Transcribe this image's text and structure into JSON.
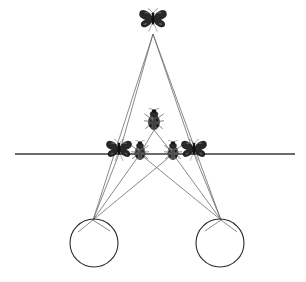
{
  "canvas": {
    "width": 306,
    "height": 282,
    "background": "#ffffff"
  },
  "figure": {
    "stroke_color": "#6b6b6b",
    "axis_color": "#3a3a3a",
    "circle_color": "#2b2b2b",
    "stroke_width": 0.8,
    "axis_width": 1.4,
    "circle_width": 1.1
  },
  "axis": {
    "name": "horizontal-axis",
    "x1": 15,
    "y1": 154,
    "x2": 295,
    "y2": 154
  },
  "circles": [
    {
      "name": "left-circle",
      "cx": 94,
      "cy": 243,
      "r": 24
    },
    {
      "name": "right-circle",
      "cx": 220,
      "cy": 243,
      "r": 24
    }
  ],
  "nodes": {
    "apex": {
      "x": 153,
      "y": 34
    },
    "mid_beetle": {
      "x": 154,
      "y": 130
    },
    "left_butterfly": {
      "x": 119,
      "y": 154
    },
    "left_beetle": {
      "x": 140,
      "y": 154
    },
    "right_beetle": {
      "x": 173,
      "y": 154
    },
    "right_butterfly": {
      "x": 194,
      "y": 154
    },
    "left_focus": {
      "x": 93,
      "y": 220
    },
    "right_focus": {
      "x": 221,
      "y": 220
    }
  },
  "rays": [
    {
      "name": "ray-apex-to-left-focus",
      "x1": 153,
      "y1": 34,
      "x2": 93,
      "y2": 220
    },
    {
      "name": "ray-apex-to-right-focus",
      "x1": 153,
      "y1": 34,
      "x2": 221,
      "y2": 220
    },
    {
      "name": "ray-apex-to-left-butterfly",
      "x1": 153,
      "y1": 34,
      "x2": 119,
      "y2": 154
    },
    {
      "name": "ray-apex-to-right-butterfly",
      "x1": 153,
      "y1": 34,
      "x2": 194,
      "y2": 154
    },
    {
      "name": "ray-midbeetle-to-left-beetle",
      "x1": 154,
      "y1": 130,
      "x2": 140,
      "y2": 154
    },
    {
      "name": "ray-midbeetle-to-right-beetle",
      "x1": 154,
      "y1": 130,
      "x2": 173,
      "y2": 154
    },
    {
      "name": "ray-left-beetle-to-left-focus",
      "x1": 140,
      "y1": 154,
      "x2": 93,
      "y2": 220
    },
    {
      "name": "ray-right-beetle-to-right-focus",
      "x1": 173,
      "y1": 154,
      "x2": 221,
      "y2": 220
    },
    {
      "name": "ray-left-butterfly-to-left-focus",
      "x1": 119,
      "y1": 154,
      "x2": 93,
      "y2": 220
    },
    {
      "name": "ray-right-butterfly-to-right-focus",
      "x1": 194,
      "y1": 154,
      "x2": 221,
      "y2": 220
    },
    {
      "name": "ray-right-beetle-to-left-focus",
      "x1": 173,
      "y1": 154,
      "x2": 93,
      "y2": 220
    },
    {
      "name": "ray-left-beetle-to-right-focus",
      "x1": 140,
      "y1": 154,
      "x2": 221,
      "y2": 220
    },
    {
      "name": "ray-left-focus-to-circle-left",
      "x1": 93,
      "y1": 220,
      "x2": 78,
      "y2": 232
    },
    {
      "name": "ray-left-focus-to-circle-right",
      "x1": 93,
      "y1": 220,
      "x2": 110,
      "y2": 231
    },
    {
      "name": "ray-right-focus-to-circle-left",
      "x1": 221,
      "y1": 220,
      "x2": 205,
      "y2": 231
    },
    {
      "name": "ray-right-focus-to-circle-right",
      "x1": 221,
      "y1": 220,
      "x2": 237,
      "y2": 232
    }
  ],
  "insects": [
    {
      "name": "butterfly-top",
      "kind": "butterfly",
      "label": "Butterfly (apex object)",
      "x": 153,
      "y": 22,
      "size": 30,
      "color": "#1c1c1c"
    },
    {
      "name": "beetle-center",
      "kind": "beetle",
      "label": "Beetle (center image)",
      "x": 154,
      "y": 122,
      "size": 21,
      "color": "#4a4a4a"
    },
    {
      "name": "butterfly-left",
      "kind": "butterfly",
      "label": "Butterfly (left on axis)",
      "x": 119,
      "y": 152,
      "size": 28,
      "color": "#1c1c1c"
    },
    {
      "name": "beetle-left",
      "kind": "beetle",
      "label": "Beetle (left inner on axis)",
      "x": 140,
      "y": 153,
      "size": 19,
      "color": "#5a5a5a"
    },
    {
      "name": "beetle-right",
      "kind": "beetle",
      "label": "Beetle (right inner on axis)",
      "x": 173,
      "y": 153,
      "size": 19,
      "color": "#5a5a5a"
    },
    {
      "name": "butterfly-right",
      "kind": "butterfly",
      "label": "Butterfly (right on axis)",
      "x": 194,
      "y": 152,
      "size": 28,
      "color": "#1c1c1c"
    }
  ]
}
